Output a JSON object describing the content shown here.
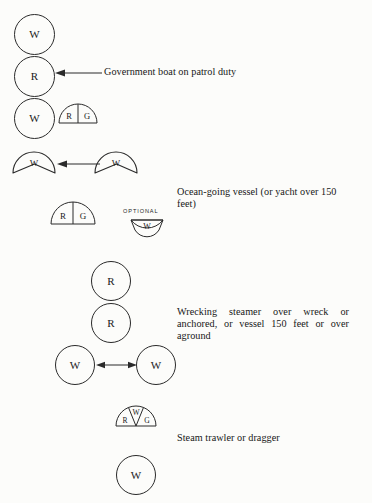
{
  "page": {
    "background_color": "#fcfcfa",
    "ink_color": "#1a1a1a"
  },
  "groups": [
    {
      "id": "government-boat",
      "caption": "Government boat on patrol duty",
      "symbols": [
        {
          "kind": "circle",
          "label": "W"
        },
        {
          "kind": "circle",
          "label": "R"
        },
        {
          "kind": "circle",
          "label": "W"
        },
        {
          "kind": "half-disc-2",
          "labels": [
            "R",
            "G"
          ]
        }
      ]
    },
    {
      "id": "ocean-going-vessel",
      "caption": "Ocean-going vessel (or yacht over 150 feet)",
      "symbols": [
        {
          "kind": "bowl",
          "label": "W"
        },
        {
          "kind": "bowl",
          "label": "W"
        },
        {
          "kind": "half-disc-2",
          "labels": [
            "R",
            "G"
          ]
        },
        {
          "kind": "fan-down",
          "label": "W",
          "note": "OPTIONAL"
        }
      ]
    },
    {
      "id": "wrecking-steamer",
      "caption": "Wrecking steamer over wreck or anchored, or vessel 150 feet or over aground",
      "symbols": [
        {
          "kind": "circle",
          "label": "R"
        },
        {
          "kind": "circle",
          "label": "R"
        },
        {
          "kind": "circle",
          "label": "W"
        },
        {
          "kind": "circle",
          "label": "W"
        }
      ]
    },
    {
      "id": "steam-trawler",
      "caption": "Steam trawler or dragger",
      "symbols": [
        {
          "kind": "half-disc-3",
          "labels": [
            "R",
            "W",
            "G"
          ]
        },
        {
          "kind": "circle",
          "label": "W"
        }
      ]
    }
  ],
  "labels": {
    "w": "W",
    "r": "R",
    "g": "G",
    "optional": "OPTIONAL"
  },
  "captions": {
    "government_boat": "Government boat on patrol duty",
    "ocean_going": "Ocean-going vessel (or yacht over 150 feet)",
    "wrecking_steamer": "Wrecking steamer over wreck or anchored, or vessel 150 feet or over aground",
    "steam_trawler": "Steam trawler or dragger"
  }
}
